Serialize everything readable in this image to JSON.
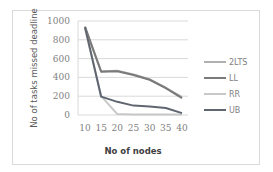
{
  "chart_data": {
    "type": "line",
    "title": "",
    "xlabel": "No of nodes",
    "ylabel": "No of tasks missed deadline",
    "x": [
      10,
      15,
      20,
      25,
      30,
      35,
      40
    ],
    "xticks": [
      "10",
      "15",
      "20",
      "25",
      "30",
      "35",
      "40"
    ],
    "yticks": [
      "0",
      "200",
      "400",
      "600",
      "800",
      "1000"
    ],
    "ylim": [
      0,
      1000
    ],
    "grid": true,
    "legend_position": "right",
    "series": [
      {
        "name": "2LTS",
        "color": "#b0b0b0",
        "values": [
          930,
          465,
          470,
          430,
          380,
          290,
          190
        ]
      },
      {
        "name": "LL",
        "color": "#7a7a7a",
        "values": [
          940,
          460,
          465,
          425,
          375,
          285,
          180
        ]
      },
      {
        "name": "RR",
        "color": "#c8c8c8",
        "values": [
          920,
          200,
          10,
          5,
          5,
          5,
          5
        ]
      },
      {
        "name": "UB",
        "color": "#606670",
        "values": [
          935,
          195,
          140,
          100,
          90,
          75,
          20
        ]
      }
    ]
  }
}
